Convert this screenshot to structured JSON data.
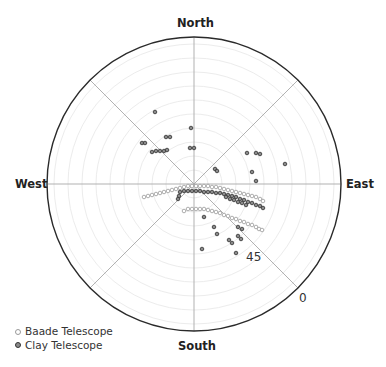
{
  "chart_data": {
    "type": "scatter",
    "subtype": "polar",
    "title": "",
    "directions": {
      "north": "North",
      "south": "South",
      "east": "East",
      "west": "West"
    },
    "radial_axis": {
      "label_outer": "0",
      "label_mid": "45",
      "outer_value": 0,
      "center_value": 90,
      "note": "altitude in degrees; center = zenith (90), rim = horizon (0)"
    },
    "grid": true,
    "spokes_deg": [
      0,
      45,
      90,
      135,
      180,
      225,
      270,
      315
    ],
    "legend": [
      {
        "name": "Baade Telescope",
        "marker": "open-circle"
      },
      {
        "name": "Clay Telescope",
        "marker": "filled-circle"
      }
    ],
    "series": [
      {
        "name": "Baade Telescope",
        "points_xy_px": [
          [
            144,
            197
          ],
          [
            148,
            196
          ],
          [
            152,
            195
          ],
          [
            156,
            194
          ],
          [
            160,
            193
          ],
          [
            164,
            192
          ],
          [
            168,
            191
          ],
          [
            172,
            190
          ],
          [
            176,
            189
          ],
          [
            180,
            188
          ],
          [
            184,
            187
          ],
          [
            188,
            186
          ],
          [
            192,
            186
          ],
          [
            196,
            186
          ],
          [
            200,
            186
          ],
          [
            204,
            186
          ],
          [
            208,
            186
          ],
          [
            212,
            187
          ],
          [
            216,
            187
          ],
          [
            220,
            188
          ],
          [
            224,
            189
          ],
          [
            228,
            190
          ],
          [
            232,
            191
          ],
          [
            236,
            192
          ],
          [
            240,
            193
          ],
          [
            244,
            194
          ],
          [
            248,
            195
          ],
          [
            252,
            196
          ],
          [
            256,
            197
          ],
          [
            260,
            199
          ],
          [
            263,
            201
          ],
          [
            184,
            211
          ],
          [
            188,
            209
          ],
          [
            192,
            209
          ],
          [
            196,
            209
          ],
          [
            200,
            209
          ],
          [
            204,
            209
          ],
          [
            208,
            210
          ],
          [
            212,
            211
          ],
          [
            216,
            212
          ],
          [
            220,
            213
          ],
          [
            224,
            215
          ],
          [
            228,
            216
          ],
          [
            232,
            218
          ],
          [
            236,
            219
          ],
          [
            240,
            221
          ],
          [
            244,
            222
          ],
          [
            248,
            224
          ],
          [
            252,
            225
          ],
          [
            256,
            227
          ],
          [
            259,
            229
          ],
          [
            262,
            230
          ]
        ]
      },
      {
        "name": "Clay Telescope",
        "points_xy_px": [
          [
            155,
            112
          ],
          [
            191,
            128
          ],
          [
            166,
            137
          ],
          [
            170,
            137
          ],
          [
            142,
            143
          ],
          [
            145,
            143
          ],
          [
            152,
            152
          ],
          [
            156,
            151
          ],
          [
            160,
            151
          ],
          [
            164,
            151
          ],
          [
            167,
            150
          ],
          [
            190,
            148
          ],
          [
            194,
            148
          ],
          [
            247,
            153
          ],
          [
            256,
            153
          ],
          [
            260,
            154
          ],
          [
            285,
            164
          ],
          [
            215,
            169
          ],
          [
            217,
            171
          ],
          [
            252,
            172
          ],
          [
            256,
            181
          ],
          [
            180,
            192
          ],
          [
            184,
            191
          ],
          [
            188,
            191
          ],
          [
            192,
            191
          ],
          [
            196,
            191
          ],
          [
            200,
            191
          ],
          [
            204,
            192
          ],
          [
            208,
            192
          ],
          [
            212,
            192
          ],
          [
            216,
            193
          ],
          [
            220,
            193
          ],
          [
            224,
            194
          ],
          [
            228,
            195
          ],
          [
            232,
            196
          ],
          [
            236,
            197
          ],
          [
            240,
            199
          ],
          [
            244,
            200
          ],
          [
            248,
            202
          ],
          [
            252,
            203
          ],
          [
            256,
            205
          ],
          [
            260,
            206
          ],
          [
            263,
            208
          ],
          [
            179,
            196
          ],
          [
            178,
            199
          ],
          [
            226,
            197
          ],
          [
            230,
            199
          ],
          [
            234,
            200
          ],
          [
            238,
            202
          ],
          [
            242,
            203
          ],
          [
            246,
            205
          ],
          [
            204,
            217
          ],
          [
            214,
            227
          ],
          [
            217,
            234
          ],
          [
            238,
            227
          ],
          [
            242,
            229
          ],
          [
            238,
            236
          ],
          [
            241,
            239
          ],
          [
            229,
            240
          ],
          [
            232,
            243
          ],
          [
            202,
            249
          ],
          [
            236,
            253
          ]
        ]
      }
    ]
  },
  "labels": {
    "north": "North",
    "south": "South",
    "east": "East",
    "west": "West",
    "ring_45": "45",
    "ring_0": "0"
  },
  "legend": {
    "baade": "Baade Telescope",
    "clay": "Clay Telescope"
  }
}
